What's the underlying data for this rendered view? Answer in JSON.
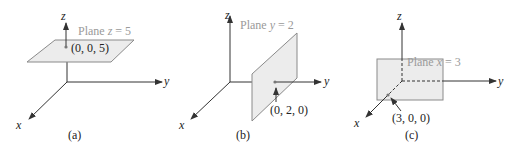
{
  "figure": {
    "panels": [
      {
        "id": "a",
        "caption": "(a)",
        "plane_label": "Plane z = 5",
        "plane_var": "z",
        "plane_rest": " = 5",
        "point_label": "(0, 0, 5)",
        "axes": {
          "x": "x",
          "y": "y",
          "z": "z"
        }
      },
      {
        "id": "b",
        "caption": "(b)",
        "plane_label": "Plane y = 2",
        "plane_var": "y",
        "plane_rest": " = 2",
        "point_label": "(0, 2, 0)",
        "axes": {
          "x": "x",
          "y": "y",
          "z": "z"
        }
      },
      {
        "id": "c",
        "caption": "(c)",
        "plane_label": "Plane x = 3",
        "plane_var": "x",
        "plane_rest": " = 3",
        "point_label": "(3, 0, 0)",
        "axes": {
          "x": "x",
          "y": "y",
          "z": "z"
        }
      }
    ],
    "plane_prefix": "Plane ",
    "colors": {
      "plane_fill": "#ececec",
      "plane_stroke": "#8a8a8a",
      "axis": "#333333",
      "plane_label": "#9a9a9a"
    }
  }
}
